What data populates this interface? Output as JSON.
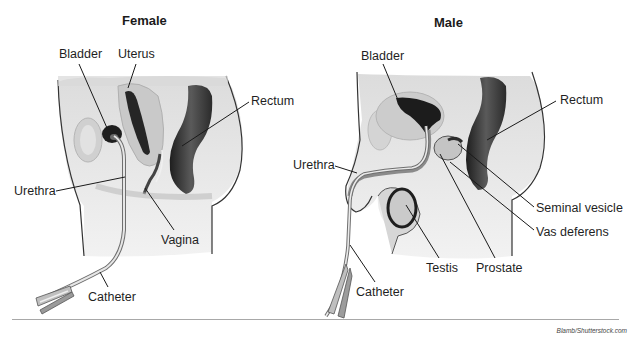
{
  "figure": {
    "panels": [
      {
        "id": "female",
        "title": "Female",
        "title_pos": [
          122,
          13
        ],
        "labels": [
          {
            "id": "bladder",
            "text": "Bladder",
            "pos": [
              59,
              48
            ],
            "leader": [
              [
                79,
                64
              ],
              [
                107,
                128
              ]
            ]
          },
          {
            "id": "uterus",
            "text": "Uterus",
            "pos": [
              118,
              48
            ],
            "leader": [
              [
                136,
                64
              ],
              [
                128,
                88
              ]
            ]
          },
          {
            "id": "rectum",
            "text": "Rectum",
            "pos": [
              251,
              95
            ],
            "leader": [
              [
                249,
                102
              ],
              [
                182,
                146
              ]
            ]
          },
          {
            "id": "urethra",
            "text": "Urethra",
            "pos": [
              14,
              185
            ],
            "leader": [
              [
                56,
                191
              ],
              [
                125,
                177
              ]
            ]
          },
          {
            "id": "vagina",
            "text": "Vagina",
            "pos": [
              161,
              234
            ],
            "leader": [
              [
                174,
                230
              ],
              [
                145,
                188
              ]
            ]
          },
          {
            "id": "catheter",
            "text": "Catheter",
            "pos": [
              88,
              291
            ],
            "leader": [
              [
                108,
                287
              ],
              [
                100,
                272
              ]
            ]
          }
        ]
      },
      {
        "id": "male",
        "title": "Male",
        "title_pos": [
          434,
          15
        ],
        "labels": [
          {
            "id": "bladder",
            "text": "Bladder",
            "pos": [
              361,
              50
            ],
            "leader": [
              [
                383,
                64
              ],
              [
                398,
                100
              ]
            ]
          },
          {
            "id": "rectum",
            "text": "Rectum",
            "pos": [
              560,
              94
            ],
            "leader": [
              [
                556,
                101
              ],
              [
                487,
                140
              ]
            ]
          },
          {
            "id": "urethra",
            "text": "Urethra",
            "pos": [
              293,
              159
            ],
            "leader": [
              [
                335,
                166
              ],
              [
                357,
                173
              ]
            ]
          },
          {
            "id": "seminal-vesicle",
            "text": "Seminal vesicle",
            "pos": [
              536,
              202
            ],
            "leader": [
              [
                534,
                207
              ],
              [
                458,
                144
              ]
            ]
          },
          {
            "id": "vas-deferens",
            "text": "Vas deferens",
            "pos": [
              536,
              226
            ],
            "leader": [
              [
                534,
                230
              ],
              [
                450,
                162
              ]
            ]
          },
          {
            "id": "testis",
            "text": "Testis",
            "pos": [
              426,
              262
            ],
            "leader": [
              [
                439,
                258
              ],
              [
                406,
                205
              ]
            ]
          },
          {
            "id": "prostate",
            "text": "Prostate",
            "pos": [
              476,
              262
            ],
            "leader": [
              [
                495,
                258
              ],
              [
                440,
                154
              ]
            ]
          },
          {
            "id": "catheter",
            "text": "Catheter",
            "pos": [
              356,
              286
            ],
            "leader": [
              [
                375,
                282
              ],
              [
                350,
                245
              ]
            ]
          }
        ]
      }
    ],
    "credit": "Blamb/Shutterstock.com",
    "colors": {
      "tissue_light": "#e6e6e6",
      "tissue_mid": "#cfcfcf",
      "tissue_dark": "#a9a9a9",
      "organ_dark": "#2a2a2a",
      "outline": "#3a3a3a",
      "leader": "#1a1a1a",
      "catheter": "#bdbdbd"
    }
  }
}
